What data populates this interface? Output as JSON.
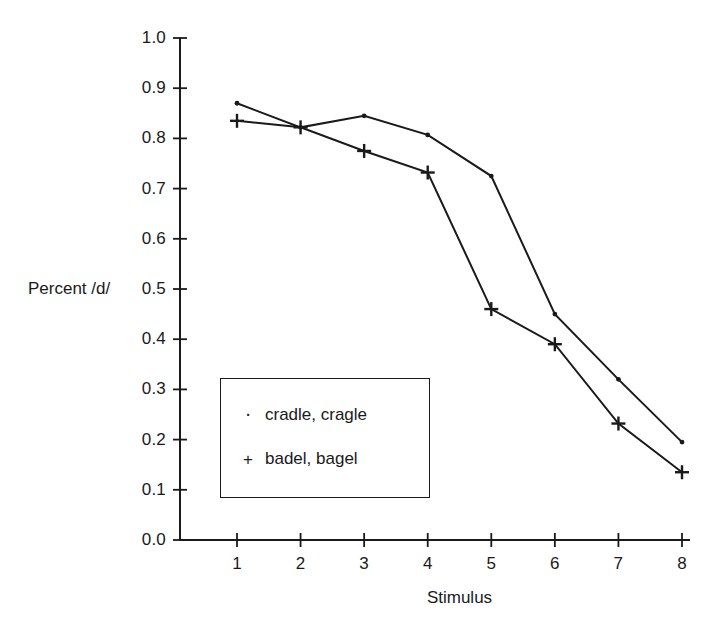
{
  "chart_data": {
    "type": "line",
    "title": "",
    "xlabel": "Stimulus",
    "ylabel": "Percent /d/",
    "x": [
      1,
      2,
      3,
      4,
      5,
      6,
      7,
      8
    ],
    "xlim": [
      0,
      8
    ],
    "ylim": [
      0.0,
      1.0
    ],
    "xticks": [
      "1",
      "2",
      "3",
      "4",
      "5",
      "6",
      "7",
      "8"
    ],
    "yticks": [
      "0.0",
      "0.1",
      "0.2",
      "0.3",
      "0.4",
      "0.5",
      "0.6",
      "0.7",
      "0.8",
      "0.9",
      "1.0"
    ],
    "grid": false,
    "legend_position": "lower-left-inside",
    "series": [
      {
        "name": "cradle, cragle",
        "marker": "dot",
        "marker_glyph": "·",
        "color": "#1a1a1a",
        "values": [
          0.87,
          0.822,
          0.845,
          0.807,
          0.725,
          0.45,
          0.32,
          0.195
        ]
      },
      {
        "name": "badel, bagel",
        "marker": "plus",
        "marker_glyph": "+",
        "color": "#1a1a1a",
        "values": [
          0.835,
          0.822,
          0.775,
          0.732,
          0.46,
          0.39,
          0.232,
          0.135
        ]
      }
    ]
  },
  "axes": {
    "y_axis_label": "Percent /d/",
    "x_axis_label": "Stimulus"
  },
  "legend": {
    "entries": [
      {
        "marker": "·",
        "label": "cradle, cragle"
      },
      {
        "marker": "+",
        "label": "badel, bagel"
      }
    ]
  },
  "colors": {
    "line": "#1a1a1a",
    "axis": "#1a1a1a",
    "background": "#ffffff"
  }
}
